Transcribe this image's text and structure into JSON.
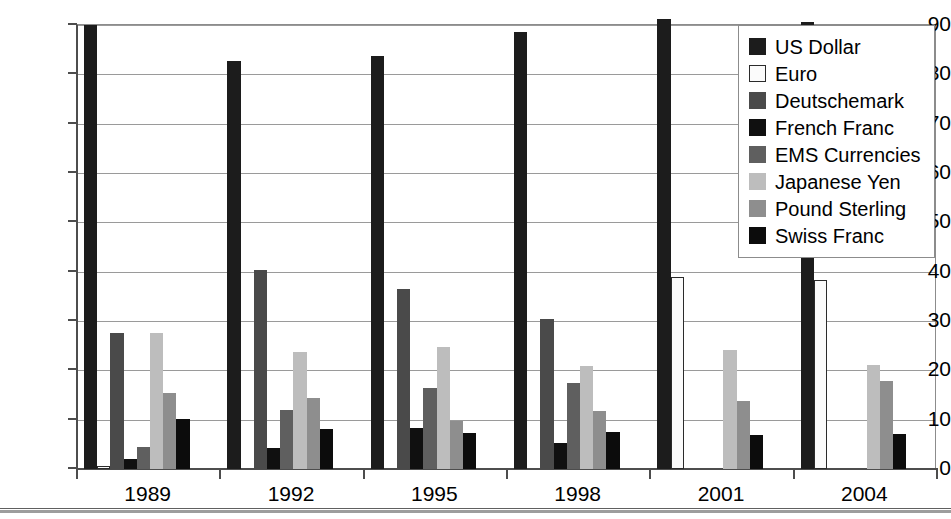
{
  "chart_data": {
    "type": "bar",
    "title": "",
    "subtitle": "",
    "xlabel": "",
    "ylabel": "",
    "categories": [
      "1989",
      "1992",
      "1995",
      "1998",
      "2001",
      "2004"
    ],
    "ylim": [
      0,
      90
    ],
    "yticks": [
      0,
      10,
      20,
      30,
      40,
      50,
      60,
      70,
      80,
      90
    ],
    "ytick_labels": [
      "0",
      "10",
      "20",
      "30",
      "40",
      "50",
      "60",
      "70",
      "80",
      "90"
    ],
    "grid": true,
    "legend_position": "top-right",
    "series": [
      {
        "name": "US Dollar",
        "color": "#1c1c1c",
        "swatch": "sw-usd",
        "values": [
          90.0,
          82.8,
          83.8,
          88.5,
          91.2,
          90.6
        ]
      },
      {
        "name": "Euro",
        "color": "#fbfbfb",
        "swatch": "sw-eur",
        "values": [
          0.7,
          0,
          0,
          0,
          39.0,
          38.4
        ]
      },
      {
        "name": "Deutschemark",
        "color": "#4a4a4a",
        "swatch": "sw-dem",
        "values": [
          27.5,
          40.3,
          36.4,
          30.5,
          0,
          0
        ]
      },
      {
        "name": "French Franc",
        "color": "#101010",
        "swatch": "sw-frf",
        "values": [
          2.0,
          4.3,
          8.4,
          5.3,
          0,
          0
        ]
      },
      {
        "name": "EMS Currencies",
        "color": "#5f5f5f",
        "swatch": "sw-ems",
        "values": [
          4.5,
          12.0,
          16.5,
          17.5,
          0,
          0
        ]
      },
      {
        "name": "Japanese Yen",
        "color": "#bdbdbd",
        "swatch": "sw-jpy",
        "values": [
          27.5,
          23.7,
          24.8,
          20.8,
          24.1,
          21.0
        ]
      },
      {
        "name": "Pound Sterling",
        "color": "#8e8e8e",
        "swatch": "sw-gbp",
        "values": [
          15.5,
          14.3,
          9.8,
          11.7,
          13.7,
          17.9
        ]
      },
      {
        "name": "Swiss Franc",
        "color": "#0c0c0c",
        "swatch": "sw-chf",
        "values": [
          10.2,
          8.1,
          7.2,
          7.6,
          6.9,
          7.0
        ]
      }
    ]
  }
}
